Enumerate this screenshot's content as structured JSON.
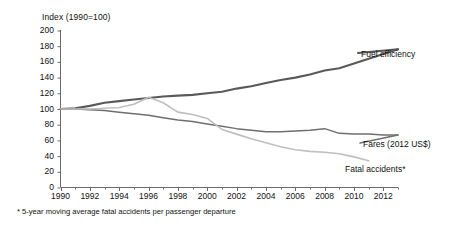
{
  "chart_data": {
    "type": "line",
    "title": "",
    "ylabel": "Index (1990=100)",
    "xlabel": "",
    "ylim": [
      0,
      200
    ],
    "xlim": [
      1990,
      2013
    ],
    "yticks": [
      0,
      20,
      40,
      60,
      80,
      100,
      120,
      140,
      160,
      180,
      200
    ],
    "xticks": [
      1990,
      1992,
      1994,
      1996,
      1998,
      2000,
      2002,
      2004,
      2006,
      2008,
      2010,
      2012
    ],
    "grid": false,
    "legend_position": "right-inline",
    "footnote": "* 5-year moving average fatal accidents per passenger departure",
    "x": [
      1990,
      1991,
      1992,
      1993,
      1994,
      1995,
      1996,
      1997,
      1998,
      1999,
      2000,
      2001,
      2002,
      2003,
      2004,
      2005,
      2006,
      2007,
      2008,
      2009,
      2010,
      2011,
      2012,
      2013
    ],
    "series": [
      {
        "name": "Fuel efficiency",
        "color": "#595959",
        "width": 2.1,
        "values": [
          100,
          101,
          104,
          108,
          110,
          112,
          114,
          116,
          117,
          118,
          120,
          122,
          126,
          129,
          133,
          137,
          140,
          144,
          149,
          152,
          158,
          164,
          170,
          176
        ]
      },
      {
        "name": "Fares (2012 US$)",
        "color": "#6e6e6e",
        "width": 1.5,
        "values": [
          100,
          100,
          99,
          98,
          96,
          94,
          92,
          89,
          86,
          84,
          81,
          78,
          75,
          73,
          71,
          71,
          72,
          73,
          75,
          69,
          68,
          68,
          67,
          67
        ]
      },
      {
        "name": "Fatal accidents*",
        "color": "#bfbfbf",
        "width": 1.6,
        "values": [
          100,
          100,
          100,
          101,
          102,
          106,
          115,
          108,
          96,
          93,
          88,
          74,
          68,
          62,
          57,
          52,
          48,
          46,
          45,
          43,
          39,
          34,
          null,
          null
        ]
      }
    ]
  },
  "axis": {
    "y_title": "Index (1990=100)",
    "y_labels": [
      "200",
      "180",
      "160",
      "140",
      "120",
      "100",
      "80",
      "60",
      "40",
      "20",
      "0"
    ],
    "x_labels": [
      "1990",
      "1992",
      "1994",
      "1996",
      "1998",
      "2000",
      "2002",
      "2004",
      "2006",
      "2008",
      "2010",
      "2012"
    ]
  },
  "labels": {
    "fuel_efficiency": "Fuel efficiency",
    "fares": "Fares (2012 US$)",
    "fatal_accidents": "Fatal accidents*"
  },
  "footnote": "* 5-year moving average fatal accidents per passenger departure"
}
